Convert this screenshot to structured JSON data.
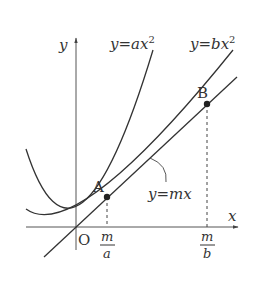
{
  "diagram": {
    "axes": {
      "x_label": "x",
      "y_label": "y",
      "origin_label": "O"
    },
    "curves": [
      {
        "name": "parabola-a",
        "label": "y=ax²",
        "label_main": "y=ax",
        "label_exp": "2"
      },
      {
        "name": "parabola-b",
        "label": "y=bx²",
        "label_main": "y=bx",
        "label_exp": "2"
      },
      {
        "name": "line-m",
        "label": "y=mx"
      }
    ],
    "points": [
      {
        "name": "A",
        "label": "A"
      },
      {
        "name": "B",
        "label": "B"
      }
    ],
    "ticks": [
      {
        "num": "m",
        "den": "a"
      },
      {
        "num": "m",
        "den": "b"
      }
    ],
    "colors": {
      "stroke": "#333333",
      "axis": "#555555",
      "background": "#ffffff"
    }
  }
}
